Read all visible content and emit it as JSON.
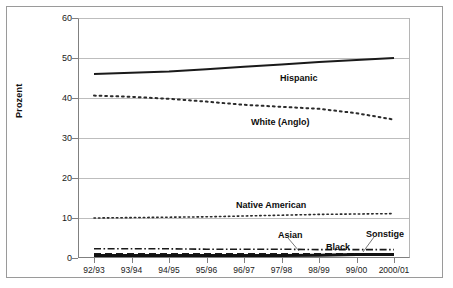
{
  "chart_data": {
    "type": "line",
    "title": "",
    "xlabel": "",
    "ylabel": "Prozent",
    "ylim": [
      0,
      60
    ],
    "ytick_values": [
      0,
      10,
      20,
      30,
      40,
      50,
      60
    ],
    "ytick_labels": [
      "0",
      "10",
      "20",
      "30",
      "40",
      "50",
      "60"
    ],
    "grid": true,
    "legend_position": "inline-annotations",
    "categories": [
      "92/93",
      "93/94",
      "94/95",
      "95/96",
      "96/97",
      "97/98",
      "98/99",
      "99/00",
      "2000/01"
    ],
    "series": [
      {
        "name": "Hispanic",
        "style": "solid",
        "color": "#1a1a1a",
        "width": 2.0,
        "values": [
          46.0,
          46.3,
          46.6,
          47.2,
          47.8,
          48.4,
          49.0,
          49.5,
          50.0
        ],
        "label": "Hispanic",
        "label_x": 280,
        "label_y": 73
      },
      {
        "name": "White (Anglo)",
        "style": "dotted",
        "color": "#2b2b2b",
        "width": 2.0,
        "values": [
          40.6,
          40.3,
          39.8,
          39.1,
          38.3,
          37.8,
          37.3,
          36.2,
          34.6
        ],
        "label": "White (Anglo)",
        "label_x": 251,
        "label_y": 117
      },
      {
        "name": "Native American",
        "style": "dotted",
        "color": "#2b2b2b",
        "width": 1.6,
        "values": [
          10.0,
          10.1,
          10.2,
          10.3,
          10.5,
          10.7,
          10.9,
          11.0,
          11.1
        ],
        "label": "Native American",
        "label_x": 236,
        "label_y": 200
      },
      {
        "name": "Asian",
        "style": "dashdot",
        "color": "#1a1a1a",
        "width": 1.6,
        "values": [
          2.3,
          2.3,
          2.3,
          2.2,
          2.2,
          2.2,
          2.1,
          2.1,
          2.1
        ],
        "label": "Asian",
        "label_x": 278,
        "label_y": 230
      },
      {
        "name": "Black",
        "style": "dashed",
        "color": "#1a1a1a",
        "width": 2.2,
        "values": [
          1.0,
          1.0,
          1.0,
          1.0,
          1.0,
          1.0,
          1.0,
          1.0,
          1.0
        ],
        "label": "Black",
        "label_x": 326,
        "label_y": 242
      },
      {
        "name": "Sonstige",
        "style": "solid-thick",
        "color": "#111111",
        "width": 3.0,
        "values": [
          0.6,
          0.6,
          0.6,
          0.6,
          0.6,
          0.6,
          0.7,
          0.9,
          0.9
        ],
        "label": "Sonstige",
        "label_x": 366,
        "label_y": 229
      }
    ],
    "annotations": [
      {
        "name": "asian-leader",
        "from_x": 288,
        "from_y": 238,
        "to_x": 299,
        "to_y": 251
      },
      {
        "name": "sonstige-leader",
        "from_x": 374,
        "from_y": 237,
        "to_x": 363,
        "to_y": 252
      }
    ]
  }
}
